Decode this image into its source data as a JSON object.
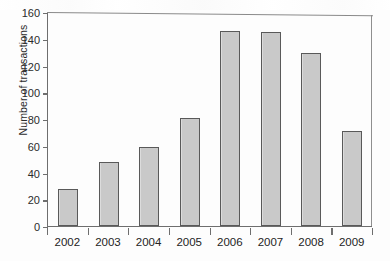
{
  "chart_data": {
    "type": "bar",
    "title": "",
    "xlabel": "",
    "ylabel": "Number of transactions",
    "categories": [
      "2002",
      "2003",
      "2004",
      "2005",
      "2006",
      "2007",
      "2008",
      "2009"
    ],
    "values": [
      28,
      48,
      59,
      81,
      146,
      145,
      129,
      71
    ],
    "ylim": [
      0,
      160
    ],
    "yticks": [
      "0",
      "20",
      "40",
      "60",
      "80",
      "100",
      "120",
      "140",
      "160"
    ],
    "ytick_values": [
      0,
      20,
      40,
      60,
      80,
      100,
      120,
      140,
      160
    ],
    "grid": false,
    "legend": false,
    "bar_color": "#c9c9c9",
    "bar_border_color": "#595959",
    "axis_color": "#6e6e6e",
    "text_color": "#242424"
  }
}
